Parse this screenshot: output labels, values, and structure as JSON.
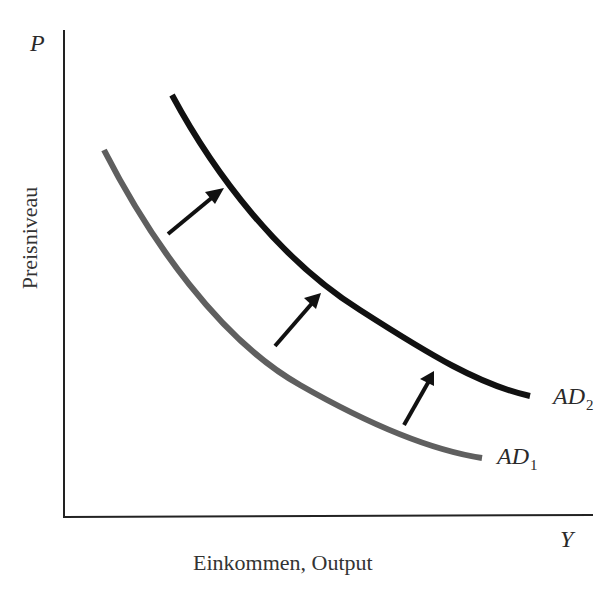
{
  "diagram": {
    "type": "aggregate-demand-shift",
    "axes": {
      "y_symbol": "P",
      "x_symbol": "Y",
      "y_title": "Preisniveau",
      "x_title": "Einkommen, Output"
    },
    "curves": [
      {
        "id": "AD1",
        "label_main": "AD",
        "label_sub": "1",
        "color": "#5f5f5f",
        "description": "original aggregate demand curve (gray)"
      },
      {
        "id": "AD2",
        "label_main": "AD",
        "label_sub": "2",
        "color": "#111111",
        "description": "shifted aggregate demand curve (black)"
      }
    ],
    "arrows": {
      "count": 3,
      "direction": "up-right, from AD1 to AD2",
      "color": "#111111"
    },
    "colors": {
      "background": "#ffffff",
      "axis": "#222222",
      "text": "#2a2a2a"
    }
  }
}
